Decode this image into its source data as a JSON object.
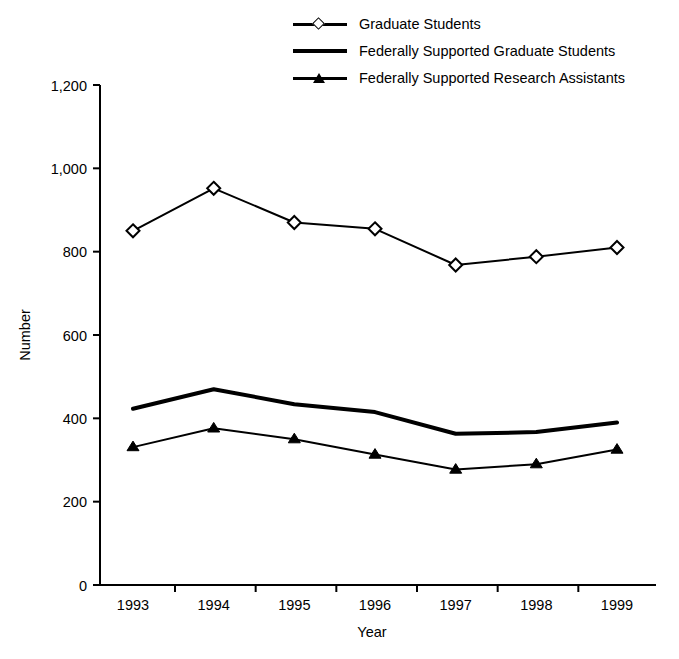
{
  "chart_data": {
    "type": "line",
    "title": "",
    "xlabel": "Year",
    "ylabel": "Number",
    "categories": [
      "1993",
      "1994",
      "1995",
      "1996",
      "1997",
      "1998",
      "1999"
    ],
    "x": [
      1993,
      1994,
      1995,
      1996,
      1997,
      1998,
      1999
    ],
    "ylim": [
      0,
      1200
    ],
    "yticks": [
      0,
      200,
      400,
      600,
      800,
      1000,
      1200
    ],
    "ytick_labels": [
      "0",
      "200",
      "400",
      "600",
      "800",
      "1,000",
      "1,200"
    ],
    "grid": false,
    "legend_position": "top-center",
    "series": [
      {
        "name": "Graduate Students",
        "marker": "open-diamond",
        "line_width": "thin",
        "values": [
          850,
          952,
          870,
          855,
          768,
          788,
          810
        ]
      },
      {
        "name": "Federally Supported Graduate Students",
        "marker": "none",
        "line_width": "thick",
        "values": [
          423,
          470,
          434,
          415,
          363,
          367,
          390
        ]
      },
      {
        "name": "Federally Supported Research Assistants",
        "marker": "filled-triangle",
        "line_width": "thin",
        "values": [
          331,
          376,
          350,
          313,
          277,
          290,
          325
        ]
      }
    ]
  },
  "legend": {
    "items": [
      {
        "label": "Graduate Students",
        "key": "line-open-diamond-marker"
      },
      {
        "label": "Federally Supported Graduate Students",
        "key": "thick-line"
      },
      {
        "label": "Federally Supported Research Assistants",
        "key": "line-filled-triangle-marker"
      }
    ]
  },
  "axes": {
    "y_title": "Number",
    "x_title": "Year"
  },
  "colors": {
    "ink": "#000000",
    "background": "#ffffff"
  }
}
